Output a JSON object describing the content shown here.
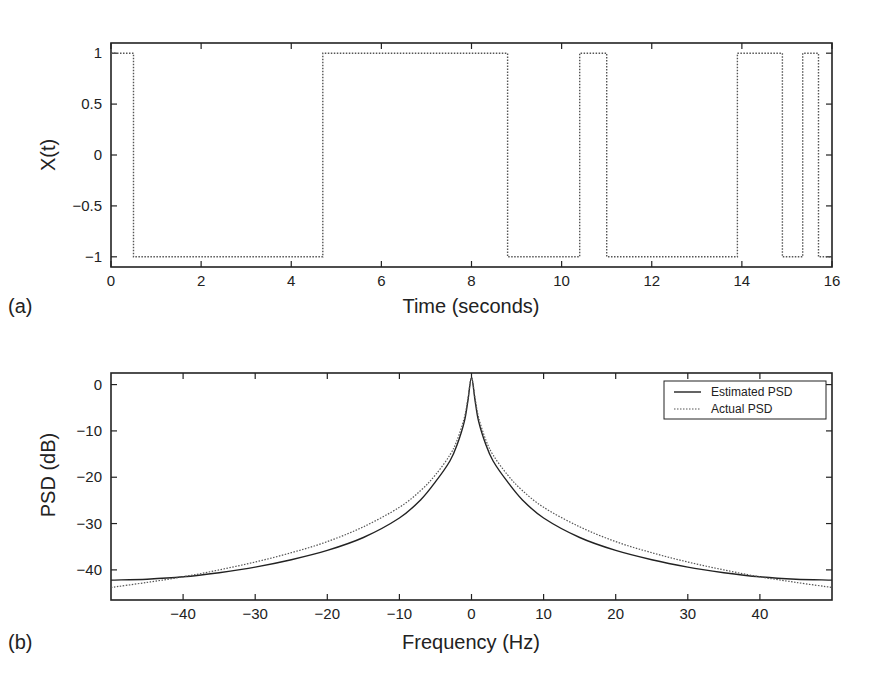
{
  "chart_data": [
    {
      "panel": "(a)",
      "type": "line",
      "style": "step",
      "title": "",
      "xlabel": "Time (seconds)",
      "ylabel": "X(t)",
      "xlim": [
        0,
        16
      ],
      "ylim": [
        -1.1,
        1.1
      ],
      "xticks": [
        0,
        2,
        4,
        6,
        8,
        10,
        12,
        14,
        16
      ],
      "yticks": [
        1,
        0.5,
        0,
        -0.5,
        -1
      ],
      "ytick_labels": [
        "1",
        "0.5",
        "0",
        "−0.5",
        "−1"
      ],
      "grid": false,
      "series": [
        {
          "name": "X(t)",
          "line": "dotted",
          "x": [
            0,
            0.5,
            0.5,
            4.7,
            4.7,
            8.8,
            8.8,
            10.4,
            10.4,
            11.0,
            11.0,
            13.9,
            13.9,
            14.9,
            14.9,
            15.35,
            15.35,
            15.7,
            15.7,
            16
          ],
          "y": [
            1,
            1,
            -1,
            -1,
            1,
            1,
            -1,
            -1,
            1,
            1,
            -1,
            -1,
            1,
            1,
            -1,
            -1,
            1,
            1,
            -1,
            -1
          ]
        }
      ]
    },
    {
      "panel": "(b)",
      "type": "line",
      "title": "",
      "xlabel": "Frequency (Hz)",
      "ylabel": "PSD (dB)",
      "xlim": [
        -50,
        50
      ],
      "ylim": [
        -46.5,
        2.5
      ],
      "xticks": [
        -40,
        -30,
        -20,
        -10,
        0,
        10,
        20,
        30,
        40
      ],
      "xtick_labels": [
        "−40",
        "−30",
        "−20",
        "−10",
        "0",
        "10",
        "20",
        "30",
        "40"
      ],
      "yticks": [
        0,
        -10,
        -20,
        -30,
        -40
      ],
      "ytick_labels": [
        "0",
        "−10",
        "−20",
        "−30",
        "−40"
      ],
      "grid": false,
      "legend": {
        "position": "upper right",
        "entries": [
          "Estimated PSD",
          "Actual PSD"
        ]
      },
      "series": [
        {
          "name": "Estimated PSD",
          "line": "solid",
          "x": [
            -50,
            -45,
            -40,
            -35,
            -30,
            -25,
            -20,
            -15,
            -10,
            -7,
            -5,
            -3,
            -2,
            -1,
            -0.5,
            0,
            0.5,
            1,
            2,
            3,
            5,
            7,
            10,
            15,
            20,
            25,
            30,
            35,
            40,
            45,
            50
          ],
          "y": [
            -42.2,
            -42.0,
            -41.5,
            -40.6,
            -39.4,
            -37.8,
            -35.8,
            -33.0,
            -28.8,
            -24.8,
            -21.0,
            -16.5,
            -13.0,
            -8.0,
            -3.5,
            1.5,
            -3.5,
            -8.0,
            -13.0,
            -16.5,
            -21.0,
            -24.8,
            -28.8,
            -33.0,
            -35.8,
            -37.8,
            -39.4,
            -40.6,
            -41.5,
            -42.0,
            -42.2
          ]
        },
        {
          "name": "Actual PSD",
          "line": "dotted",
          "x": [
            -50,
            -45,
            -40,
            -35,
            -30,
            -25,
            -20,
            -15,
            -10,
            -7,
            -5,
            -3,
            -2,
            -1,
            -0.5,
            0,
            0.5,
            1,
            2,
            3,
            5,
            7,
            10,
            15,
            20,
            25,
            30,
            35,
            40,
            45,
            50
          ],
          "y": [
            -43.8,
            -42.7,
            -41.5,
            -40.0,
            -38.3,
            -36.3,
            -33.9,
            -30.7,
            -26.5,
            -22.8,
            -19.5,
            -15.2,
            -12.0,
            -7.2,
            -3.0,
            1.5,
            -3.0,
            -7.2,
            -12.0,
            -15.2,
            -19.5,
            -22.8,
            -26.5,
            -30.7,
            -33.9,
            -36.3,
            -38.3,
            -40.0,
            -41.5,
            -42.7,
            -43.8
          ]
        }
      ]
    }
  ],
  "labels": {
    "panel_a": "(a)",
    "panel_b": "(b)",
    "a_xlabel": "Time (seconds)",
    "a_ylabel": "X(t)",
    "b_xlabel": "Frequency (Hz)",
    "b_ylabel": "PSD (dB)",
    "legend_estimated": "Estimated PSD",
    "legend_actual": "Actual PSD"
  },
  "colors": {
    "axis": "#222222",
    "line": "#333333",
    "dotted_line": "#555555",
    "background": "#ffffff"
  }
}
